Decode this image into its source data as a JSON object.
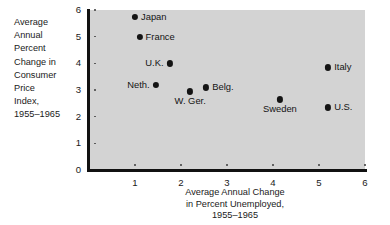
{
  "chart_data": {
    "type": "scatter",
    "title": "",
    "xlabel": "Average Annual Change in Percent Unemployed, 1955-1965",
    "ylabel": "Average Annual Percent Change in Consumer Price Index, 1955-1965",
    "xlabel_lines": [
      "Average Annual Change",
      "in Percent Unemployed,",
      "1955–1965"
    ],
    "ylabel_lines": [
      "Average",
      "Annual",
      "Percent",
      "Change in",
      "Consumer",
      "Price",
      "Index,",
      "1955–1965"
    ],
    "xlim": [
      0,
      6
    ],
    "ylim": [
      0,
      6
    ],
    "xticks": [
      1,
      2,
      3,
      4,
      5,
      6
    ],
    "yticks": [
      0,
      1,
      2,
      3,
      4,
      5,
      6
    ],
    "xtick_labels": [
      "1",
      "2",
      "3",
      "4",
      "5",
      "6"
    ],
    "ytick_labels": [
      "0",
      "1",
      "2",
      "3",
      "4",
      "5",
      "6"
    ],
    "grid": false,
    "legend": "none",
    "plot_background": "#d3d3d3",
    "marker_color": "#141414",
    "axis_color": "#111111",
    "points": [
      {
        "label": "Japan",
        "x": 1.0,
        "y": 5.75,
        "label_pos": "right"
      },
      {
        "label": "France",
        "x": 1.1,
        "y": 5.0,
        "label_pos": "right"
      },
      {
        "label": "U.K.",
        "x": 1.75,
        "y": 4.0,
        "label_pos": "left"
      },
      {
        "label": "Neth.",
        "x": 1.45,
        "y": 3.2,
        "label_pos": "left"
      },
      {
        "label": "Belg.",
        "x": 2.55,
        "y": 3.1,
        "label_pos": "right"
      },
      {
        "label": "W. Ger.",
        "x": 2.2,
        "y": 2.95,
        "label_pos": "below"
      },
      {
        "label": "Italy",
        "x": 5.2,
        "y": 3.85,
        "label_pos": "right"
      },
      {
        "label": "Sweden",
        "x": 4.15,
        "y": 2.65,
        "label_pos": "below"
      },
      {
        "label": "U.S.",
        "x": 5.2,
        "y": 2.35,
        "label_pos": "right"
      }
    ]
  }
}
